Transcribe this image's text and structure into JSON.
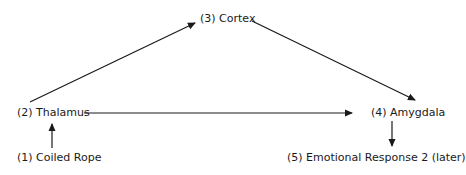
{
  "diagram": {
    "nodes": [
      {
        "id": "1",
        "label": "(1) Coiled Rope"
      },
      {
        "id": "2",
        "label": "(2) Thalamus"
      },
      {
        "id": "3",
        "label": "(3) Cortex"
      },
      {
        "id": "4",
        "label": "(4) Amygdala"
      },
      {
        "id": "5",
        "label": "(5) Emotional Response 2 (later)"
      }
    ],
    "edges": [
      {
        "from": "1",
        "to": "2"
      },
      {
        "from": "2",
        "to": "3"
      },
      {
        "from": "2",
        "to": "4"
      },
      {
        "from": "3",
        "to": "4"
      },
      {
        "from": "4",
        "to": "5"
      }
    ],
    "colors": {
      "line": "#1a1a1a",
      "background": "#ffffff"
    }
  }
}
